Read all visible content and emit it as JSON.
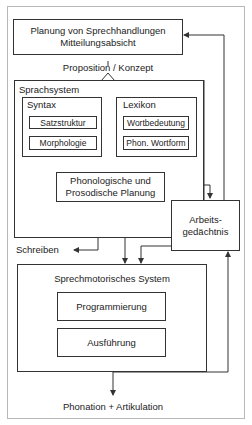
{
  "diagram": {
    "planning_box": {
      "line1": "Planung von Sprechhandlungen",
      "line2": "Mitteilungsabsicht"
    },
    "proposition_label": "Proposition / Konzept",
    "language_system": {
      "title": "Sprachsystem",
      "syntax": {
        "title": "Syntax",
        "items": [
          "Satzstruktur",
          "Morphologie"
        ]
      },
      "lexicon": {
        "title": "Lexikon",
        "items": [
          "Wortbedeutung",
          "Phon. Wortform"
        ]
      },
      "phonology_box": {
        "line1": "Phonologische und",
        "line2": "Prosodische Planung"
      }
    },
    "working_memory": {
      "line1": "Arbeits-",
      "line2": "gedächtnis"
    },
    "writing_label": "Schreiben",
    "motor_system": {
      "title": "Sprechmotorisches System",
      "items": [
        "Programmierung",
        "Ausführung"
      ]
    },
    "output_label": "Phonation + Artikulation"
  },
  "colors": {
    "line": "#333333",
    "frame": "#b8b8b8",
    "background": "#ffffff"
  }
}
